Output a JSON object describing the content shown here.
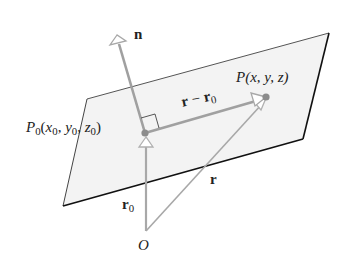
{
  "diagram": {
    "type": "vector-geometry",
    "colors": {
      "plane_fill": "#f3f3f3",
      "plane_edge_light": "#555555",
      "plane_edge_dark": "#111111",
      "vector_gray": "#a0a0a0",
      "point_fill": "#8c8c8c",
      "text": "#222222"
    },
    "labels": {
      "normal": "n",
      "point_p0": {
        "main": "P",
        "sub": "0",
        "open": "(",
        "x": "x",
        "x_sub": "0",
        "y": "y",
        "y_sub": "0",
        "z": "z",
        "z_sub": "0",
        "close": ")",
        "sep": ", "
      },
      "point_p": {
        "text": "P(x, y, z)"
      },
      "diff_vector": {
        "r": "r",
        "minus": " − ",
        "r0": "r",
        "r0_sub": "0"
      },
      "r_vector": "r",
      "r0_vector": {
        "main": "r",
        "sub": "0"
      },
      "origin": "O"
    },
    "points": {
      "O": [
        146,
        231
      ],
      "P0": [
        145,
        133
      ],
      "P": [
        266,
        97
      ],
      "n_tip": [
        117,
        36
      ]
    },
    "plane_corners": [
      [
        87,
        99
      ],
      [
        329,
        33
      ],
      [
        303,
        139
      ],
      [
        63,
        206
      ]
    ]
  }
}
